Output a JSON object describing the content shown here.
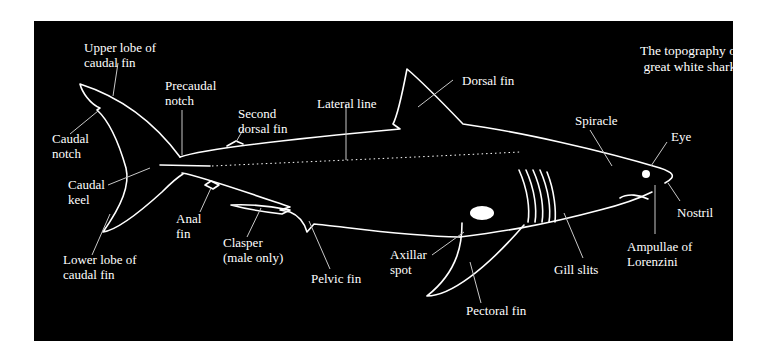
{
  "title": "The topography of the\n great white shark.",
  "colors": {
    "background": "#ffffff",
    "panel": "#000000",
    "outline": "#ffffff",
    "leader": "#c8c8c8"
  },
  "labels": {
    "upper_lobe": "Upper lobe of\ncaudal fin",
    "precaudal_notch": "Precaudal\nnotch",
    "second_dorsal_fin": "Second\ndorsal fin",
    "lateral_line": "Lateral line",
    "dorsal_fin": "Dorsal fin",
    "spiracle": "Spiracle",
    "eye": "Eye",
    "caudal_notch": "Caudal\nnotch",
    "caudal_keel": "Caudal\nkeel",
    "anal_fin": "Anal\nfin",
    "clasper": "Clasper\n(male only)",
    "lower_lobe": "Lower lobe of\ncaudal fin",
    "pelvic_fin": "Pelvic fin",
    "axillar_spot": "Axillar\nspot",
    "pectoral_fin": "Pectoral fin",
    "gill_slits": "Gill slits",
    "ampullae": "Ampullae of\nLorenzini",
    "nostril": "Nostril"
  }
}
